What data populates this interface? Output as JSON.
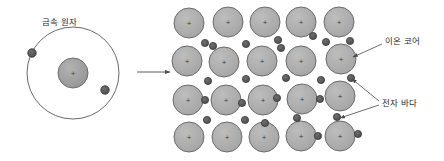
{
  "diagram": {
    "title_visible": false,
    "labels": {
      "metal_atom": "금속 원자",
      "ion_core": "이온 코어",
      "electron_sea": "전자 바다"
    },
    "colors": {
      "background": "#ffffff",
      "ion_core_fill": "#ababab",
      "ion_core_stroke": "#6b6b6b",
      "electron_fill": "#555555",
      "electron_stroke": "#3a3a3a",
      "orbit_stroke": "#58585a",
      "nucleus_fill": "#9e9e9e",
      "arrow_stroke": "#4a4a4a",
      "text": "#2b2b2b"
    },
    "atom": {
      "center": {
        "x": 73,
        "y": 73
      },
      "orbit_radius": 46,
      "nucleus_radius": 15,
      "nucleus_charge": "+",
      "electrons": [
        {
          "x": 32,
          "y": 53
        },
        {
          "x": 105,
          "y": 90
        }
      ]
    },
    "transition_arrow": {
      "from": {
        "x": 137,
        "y": 72
      },
      "to": {
        "x": 172,
        "y": 72
      }
    },
    "lattice": {
      "rows": 4,
      "cols": 5,
      "ion_radius": 15,
      "ion_charge": "+",
      "ion_centers": [
        [
          {
            "x": 189,
            "y": 23
          },
          {
            "x": 228,
            "y": 22
          },
          {
            "x": 265,
            "y": 22
          },
          {
            "x": 301,
            "y": 22
          },
          {
            "x": 339,
            "y": 22
          }
        ],
        [
          {
            "x": 187,
            "y": 61
          },
          {
            "x": 224,
            "y": 62
          },
          {
            "x": 262,
            "y": 61
          },
          {
            "x": 301,
            "y": 61
          },
          {
            "x": 341,
            "y": 59
          }
        ],
        [
          {
            "x": 188,
            "y": 100
          },
          {
            "x": 226,
            "y": 100
          },
          {
            "x": 263,
            "y": 100
          },
          {
            "x": 302,
            "y": 99
          },
          {
            "x": 340,
            "y": 96
          }
        ],
        [
          {
            "x": 189,
            "y": 137
          },
          {
            "x": 227,
            "y": 137
          },
          {
            "x": 264,
            "y": 137
          },
          {
            "x": 301,
            "y": 136
          },
          {
            "x": 340,
            "y": 136
          }
        ]
      ],
      "electron_radius": 3.6,
      "electron_centers": [
        {
          "x": 205,
          "y": 43
        },
        {
          "x": 246,
          "y": 44
        },
        {
          "x": 278,
          "y": 40
        },
        {
          "x": 313,
          "y": 36
        },
        {
          "x": 350,
          "y": 41
        },
        {
          "x": 213,
          "y": 46
        },
        {
          "x": 281,
          "y": 48
        },
        {
          "x": 326,
          "y": 42
        },
        {
          "x": 208,
          "y": 81
        },
        {
          "x": 246,
          "y": 79
        },
        {
          "x": 286,
          "y": 78
        },
        {
          "x": 321,
          "y": 80
        },
        {
          "x": 351,
          "y": 78
        },
        {
          "x": 205,
          "y": 100
        },
        {
          "x": 242,
          "y": 103
        },
        {
          "x": 277,
          "y": 98
        },
        {
          "x": 320,
          "y": 99
        },
        {
          "x": 207,
          "y": 120
        },
        {
          "x": 245,
          "y": 120
        },
        {
          "x": 297,
          "y": 118
        },
        {
          "x": 337,
          "y": 117
        },
        {
          "x": 265,
          "y": 123
        },
        {
          "x": 318,
          "y": 136
        },
        {
          "x": 358,
          "y": 134
        }
      ]
    },
    "callouts": [
      {
        "name": "ion-core",
        "label_key": "ion_core",
        "from": {
          "x": 382,
          "y": 44
        },
        "to": {
          "x": 353,
          "y": 57
        }
      },
      {
        "name": "electron-sea-upper",
        "label_key": "electron_sea",
        "from": {
          "x": 379,
          "y": 101
        },
        "to": {
          "x": 352,
          "y": 79
        }
      },
      {
        "name": "electron-sea-lower",
        "label_key": "electron_sea",
        "from": {
          "x": 379,
          "y": 105
        },
        "to": {
          "x": 340,
          "y": 118
        }
      }
    ]
  }
}
